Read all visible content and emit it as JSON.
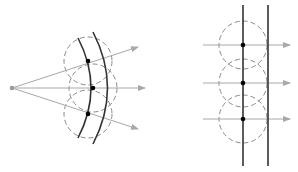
{
  "diagram": {
    "title": "",
    "colors": {
      "wavefront": "#333333",
      "ray": "#a8a8a8",
      "wavelet": "#8a8a8a",
      "point": "#000000",
      "source": "#999999"
    },
    "panels": [
      {
        "id": "spherical-wave",
        "source": {
          "x": 12,
          "y": 88
        },
        "wavefronts": [
          {
            "x1": 78,
            "y1": 38,
            "cx": 104,
            "cy": 88,
            "x2": 78,
            "y2": 138
          },
          {
            "x1": 93,
            "y1": 32,
            "cx": 122,
            "cy": 88,
            "x2": 93,
            "y2": 144
          }
        ],
        "points": [
          {
            "x": 88,
            "y": 61
          },
          {
            "x": 93,
            "y": 88
          },
          {
            "x": 88,
            "y": 114
          }
        ],
        "wavelet_radius": 24,
        "rays": [
          {
            "x2": 138,
            "y2": 47
          },
          {
            "x2": 145,
            "y2": 88
          },
          {
            "x2": 138,
            "y2": 129
          }
        ]
      },
      {
        "id": "plane-wave",
        "wavefronts": [
          {
            "x": 243,
            "y1": 5,
            "y2": 166
          },
          {
            "x": 268,
            "y1": 5,
            "y2": 166
          }
        ],
        "points": [
          {
            "x": 243,
            "y": 45
          },
          {
            "x": 243,
            "y": 83
          },
          {
            "x": 243,
            "y": 119
          }
        ],
        "wavelet_radius": 24,
        "rays": [
          {
            "x1": 203,
            "y": 45,
            "x2": 290
          },
          {
            "x1": 203,
            "y": 83,
            "x2": 290
          },
          {
            "x1": 203,
            "y": 119,
            "x2": 290
          }
        ]
      }
    ]
  }
}
